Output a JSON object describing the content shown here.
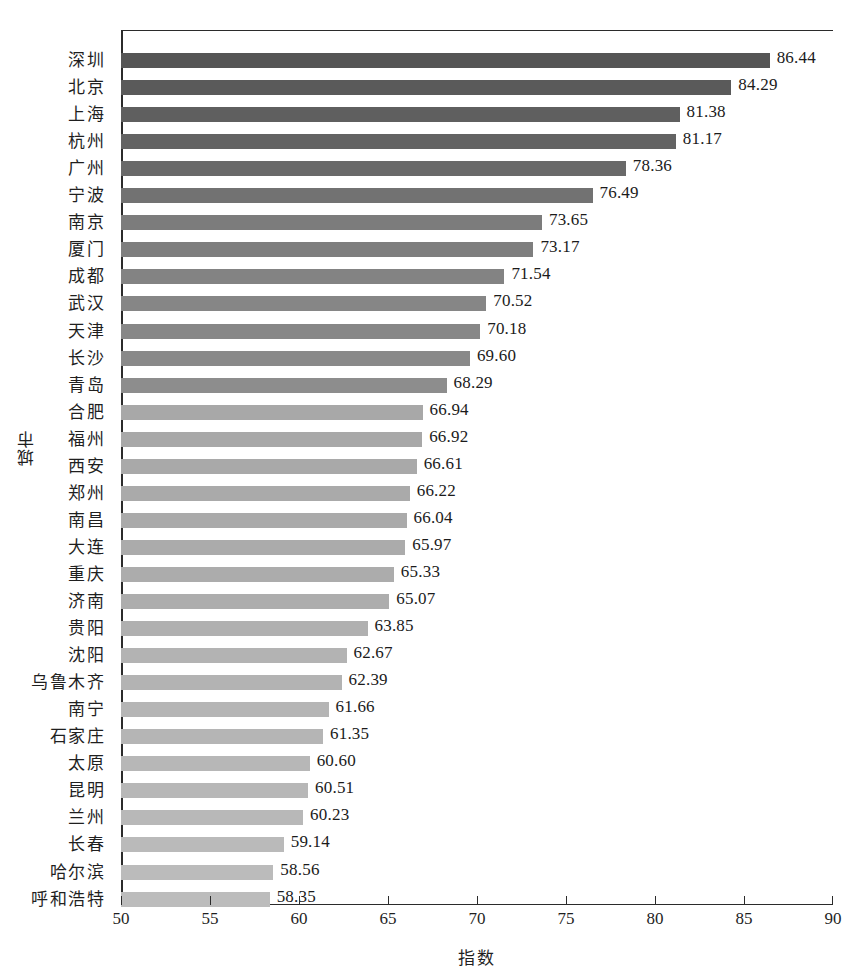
{
  "chart_data": {
    "type": "bar",
    "orientation": "horizontal",
    "title": "",
    "xlabel": "指数",
    "ylabel": "城市",
    "xlim": [
      50,
      90
    ],
    "xticks": [
      50,
      55,
      60,
      65,
      70,
      75,
      80,
      85,
      90
    ],
    "grid": false,
    "legend": null,
    "categories": [
      "深圳",
      "北京",
      "上海",
      "杭州",
      "广州",
      "宁波",
      "南京",
      "厦门",
      "成都",
      "武汉",
      "天津",
      "长沙",
      "青岛",
      "合肥",
      "福州",
      "西安",
      "郑州",
      "南昌",
      "大连",
      "重庆",
      "济南",
      "贵阳",
      "沈阳",
      "乌鲁木齐",
      "南宁",
      "石家庄",
      "太原",
      "昆明",
      "兰州",
      "长春",
      "哈尔滨",
      "呼和浩特"
    ],
    "values": [
      86.44,
      84.29,
      81.38,
      81.17,
      78.36,
      76.49,
      73.65,
      73.17,
      71.54,
      70.52,
      70.18,
      69.6,
      68.29,
      66.94,
      66.92,
      66.61,
      66.22,
      66.04,
      65.97,
      65.33,
      65.07,
      63.85,
      62.67,
      62.39,
      61.66,
      61.35,
      60.6,
      60.51,
      60.23,
      59.14,
      58.56,
      58.35
    ],
    "value_labels": [
      "86.44",
      "84.29",
      "81.38",
      "81.17",
      "78.36",
      "76.49",
      "73.65",
      "73.17",
      "71.54",
      "70.52",
      "70.18",
      "69.60",
      "68.29",
      "66.94",
      "66.92",
      "66.61",
      "66.22",
      "66.04",
      "65.97",
      "65.33",
      "65.07",
      "63.85",
      "62.67",
      "62.39",
      "61.66",
      "61.35",
      "60.60",
      "60.51",
      "60.23",
      "59.14",
      "58.56",
      "58.35"
    ],
    "bar_colors": [
      "#555555",
      "#5a5a5a",
      "#5f5f5f",
      "#636363",
      "#696969",
      "#727272",
      "#7c7c7c",
      "#7e7e7e",
      "#838383",
      "#868686",
      "#878787",
      "#898989",
      "#8d8d8d",
      "#a8a8a8",
      "#a8a8a8",
      "#a9a9a9",
      "#aaaaaa",
      "#aaaaaa",
      "#ababab",
      "#acacac",
      "#adadad",
      "#b0b0b0",
      "#b3b3b3",
      "#b3b3b3",
      "#b5b5b5",
      "#b5b5b5",
      "#b7b7b7",
      "#b7b7b7",
      "#b8b8b8",
      "#bababa",
      "#bbbbbb",
      "#bcbcbc"
    ],
    "axis_color": "#2b2b2b"
  }
}
